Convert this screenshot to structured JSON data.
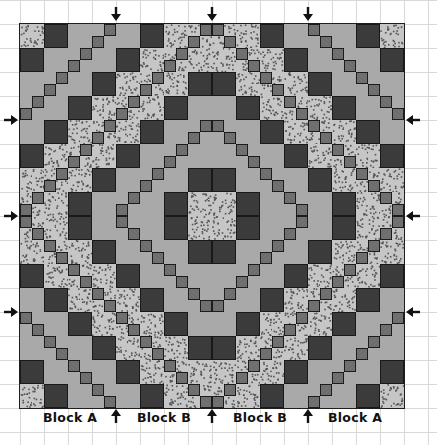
{
  "figure": {
    "grid": {
      "units": 32,
      "unit_px": 12,
      "cell_units": 2,
      "quilt_left": 20,
      "quilt_top": 24
    },
    "colors": {
      "dark": "#3b3b3b",
      "light": "#a9a9a9",
      "medium": "#6f6f6f",
      "dotted_bg": "#c6c6c6",
      "dotted_speck": "#555555",
      "outline": "#1e1e1e"
    },
    "band_sequence": [
      "dotted",
      "dark",
      "light",
      "light",
      "light",
      "dark",
      "dotted",
      "dotted"
    ],
    "stair_rule": "unit (r'+c') mod 8 == 7 -> medium",
    "symmetry": "mirrored horizontally and vertically about center"
  },
  "arrows": {
    "top": [
      {
        "x": 116,
        "dir": "down"
      },
      {
        "x": 212,
        "dir": "down"
      },
      {
        "x": 308,
        "dir": "down"
      }
    ],
    "left": [
      {
        "y": 120,
        "dir": "right"
      },
      {
        "y": 216,
        "dir": "right"
      },
      {
        "y": 312,
        "dir": "right"
      }
    ],
    "right": [
      {
        "y": 120,
        "dir": "left"
      },
      {
        "y": 216,
        "dir": "left"
      },
      {
        "y": 312,
        "dir": "left"
      }
    ],
    "bottom": [
      {
        "x": 116,
        "dir": "up"
      },
      {
        "x": 212,
        "dir": "up"
      },
      {
        "x": 308,
        "dir": "up"
      }
    ]
  },
  "labels": [
    {
      "text": "Block A",
      "x": 70
    },
    {
      "text": "Block B",
      "x": 164
    },
    {
      "text": "Block B",
      "x": 260
    },
    {
      "text": "Block A",
      "x": 355
    }
  ]
}
